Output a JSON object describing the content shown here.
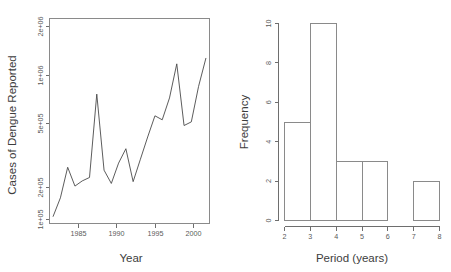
{
  "figure": {
    "background": "#ffffff",
    "line_color": "#4a4a4a",
    "axis_color": "#6e6e6e"
  },
  "chart_data": [
    {
      "type": "line",
      "title": "",
      "xlabel": "Year",
      "ylabel": "Cases of Dengue Reported",
      "yscale": "log",
      "grid": false,
      "legend": "none",
      "xlim": [
        1980.5,
        2002.5
      ],
      "ylim": [
        95000,
        2400000
      ],
      "xticks": [
        1985,
        1990,
        1995,
        2000
      ],
      "xticklabels": [
        "1985",
        "1990",
        "1995",
        "2000"
      ],
      "yticks": [
        100000,
        200000,
        500000,
        1000000,
        2000000
      ],
      "yticklabels": [
        "1e+05",
        "2e+05",
        "5e+05",
        "1e+06",
        "2e+06"
      ],
      "x": [
        1981,
        1982,
        1983,
        1984,
        1985,
        1986,
        1987,
        1988,
        1989,
        1990,
        1991,
        1992,
        1993,
        1994,
        1995,
        1996,
        1997,
        1998,
        1999,
        2000,
        2001,
        2002
      ],
      "values": [
        105000,
        140000,
        225000,
        168000,
        182000,
        192000,
        700000,
        215000,
        175000,
        240000,
        300000,
        180000,
        255000,
        360000,
        500000,
        470000,
        660000,
        1120000,
        430000,
        455000,
        790000,
        1220000
      ]
    },
    {
      "type": "bar",
      "subtype": "histogram",
      "title": "",
      "xlabel": "Period (years)",
      "ylabel": "Frequency",
      "grid": false,
      "legend": "none",
      "xlim": [
        2,
        8
      ],
      "ylim": [
        0,
        10
      ],
      "xticks": [
        2,
        3,
        4,
        5,
        6,
        7,
        8
      ],
      "xticklabels": [
        "2",
        "3",
        "4",
        "5",
        "6",
        "7",
        "8"
      ],
      "yticks": [
        0,
        2,
        4,
        6,
        8,
        10
      ],
      "yticklabels": [
        "0",
        "2",
        "4",
        "6",
        "8",
        "10"
      ],
      "bin_edges": [
        2,
        3,
        4,
        5,
        6,
        7,
        8
      ],
      "categories": [
        "2-3",
        "3-4",
        "4-5",
        "5-6",
        "6-7",
        "7-8"
      ],
      "values": [
        5,
        10,
        3,
        3,
        0,
        2
      ]
    }
  ],
  "left_panel": {
    "ylabel": "Cases of Dengue Reported",
    "xlabel": "Year",
    "yticklabels": [
      "1e+05",
      "2e+05",
      "5e+05",
      "1e+06",
      "2e+06"
    ],
    "xticklabels": [
      "1985",
      "1990",
      "1995",
      "2000"
    ]
  },
  "right_panel": {
    "ylabel": "Frequency",
    "xlabel": "Period (years)",
    "yticklabels": [
      "0",
      "2",
      "4",
      "6",
      "8",
      "10"
    ],
    "xticklabels": [
      "2",
      "3",
      "4",
      "5",
      "6",
      "7",
      "8"
    ]
  }
}
